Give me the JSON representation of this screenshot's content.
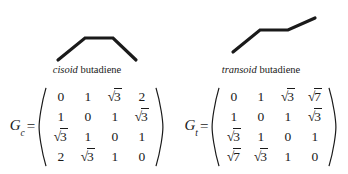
{
  "figure": {
    "background_color": "#ffffff",
    "ink_color": "#1a1a1a"
  },
  "panels": [
    {
      "id": "cisoid",
      "structure": {
        "name": "cisoid-butadiene-skeleton",
        "description": "arch shaped carbon skeleton, four carbons",
        "points": "58,55 85,33 113,33 136,55"
      },
      "label": {
        "conformer": "cisoid",
        "compound": " butadiene"
      },
      "equation": {
        "symbol": "G",
        "subscript": "c",
        "equals": "=",
        "matrix": [
          [
            "0",
            "1",
            "√3",
            "2"
          ],
          [
            "1",
            "0",
            "1",
            "√3"
          ],
          [
            "√3",
            "1",
            "0",
            "1"
          ],
          [
            "2",
            "√3",
            "1",
            "0"
          ]
        ]
      }
    },
    {
      "id": "transoid",
      "structure": {
        "name": "transoid-butadiene-skeleton",
        "description": "zig-zag carbon skeleton ascending left to right, four carbons",
        "points": "59,47 86,25 114,25 141,13"
      },
      "label": {
        "conformer": "transoid",
        "compound": " butadiene"
      },
      "equation": {
        "symbol": "G",
        "subscript": "t",
        "equals": "=",
        "matrix": [
          [
            "0",
            "1",
            "√3",
            "√7"
          ],
          [
            "1",
            "0",
            "1",
            "√3"
          ],
          [
            "√3",
            "1",
            "0",
            "1"
          ],
          [
            "√7",
            "√3",
            "1",
            "0"
          ]
        ]
      }
    }
  ]
}
